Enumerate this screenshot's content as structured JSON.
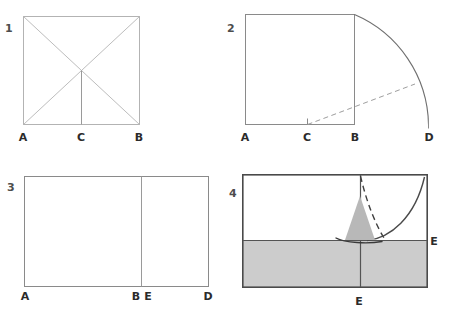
{
  "figure": {
    "canvas": {
      "width": 452,
      "height": 318
    }
  },
  "colors": {
    "background": "#ffffff",
    "line_light": "#b3b3b3",
    "line_mid": "#8a8a8a",
    "line_dark": "#4a4a4a",
    "dash": "#9e9e9e",
    "shaded_fill": "#cccccc",
    "marker_fill": "#b8b8b8",
    "label_text": "#2b2b2b",
    "number_text": "#4d4d4d"
  },
  "panels": [
    {
      "id": "panel-1",
      "number": "1",
      "shape": "square with both diagonals and a vertical centre line down to C",
      "labels": [
        {
          "text": "A",
          "position": "bottom-left"
        },
        {
          "text": "C",
          "position": "bottom-centre"
        },
        {
          "text": "B",
          "position": "bottom-right"
        }
      ]
    },
    {
      "id": "panel-2",
      "number": "2",
      "shape": "square with an arc swung from the top-right corner down to D on the extended base, plus a dashed radius from C",
      "labels": [
        {
          "text": "A",
          "position": "bottom-left"
        },
        {
          "text": "C",
          "position": "bottom-centre"
        },
        {
          "text": "B",
          "position": "bottom-right"
        },
        {
          "text": "D",
          "position": "bottom-right-extended"
        }
      ]
    },
    {
      "id": "panel-3",
      "number": "3",
      "shape": "wide rectangle divided by a vertical line at B/E",
      "labels": [
        {
          "text": "A",
          "position": "bottom-left"
        },
        {
          "text": "B",
          "position": "bottom-centre-left"
        },
        {
          "text": "E",
          "position": "bottom-centre-right"
        },
        {
          "text": "D",
          "position": "bottom-right"
        }
      ]
    },
    {
      "id": "panel-4",
      "number": "4",
      "shape": "rectangle with shaded lower half, vertical centre line, dashed fold line and arc meeting at centre, and a fold arrow marker",
      "labels": [
        {
          "text": "E",
          "position": "right-middle"
        },
        {
          "text": "E",
          "position": "bottom-centre"
        }
      ]
    }
  ]
}
